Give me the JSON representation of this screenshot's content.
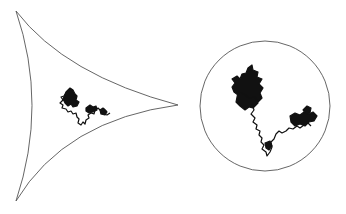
{
  "figure": {
    "colors": {
      "background": "#ffffff",
      "outline": "#555555",
      "path": "#111111"
    },
    "left_panel": {
      "shape": "concave-curved-triangle",
      "vertices": [
        [
          16,
          11
        ],
        [
          178,
          105
        ],
        [
          16,
          201
        ]
      ]
    },
    "right_panel": {
      "shape": "circle",
      "center": [
        265,
        106
      ],
      "radius": 65
    }
  }
}
